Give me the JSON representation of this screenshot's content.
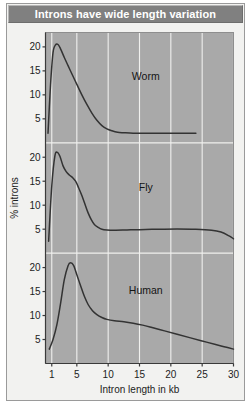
{
  "figure": {
    "title": "Introns have wide length variation",
    "xlabel": "Intron length in kb",
    "ylabel": "% introns"
  },
  "axis": {
    "x_ticks": [
      "1",
      "5",
      "10",
      "15",
      "20",
      "25",
      "30"
    ],
    "y_ticks_worm": [
      "20",
      "15",
      "10",
      "5"
    ],
    "y_ticks_fly": [
      "20",
      "15",
      "10",
      "5"
    ],
    "y_ticks_human": [
      "20",
      "15",
      "10",
      "5"
    ]
  },
  "panels": {
    "worm_label": "Worm",
    "fly_label": "Fly",
    "human_label": "Human"
  },
  "colors": {
    "title_bar": "#808080",
    "title_text": "#ffffff",
    "plot_background": "#a9a9a9",
    "gridline": "#f0f0ee",
    "curve": "#333333",
    "card_background": "#f2f2f0",
    "card_border": "#9a9a9a"
  },
  "chart_data": {
    "type": "line",
    "title": "Introns have wide length variation",
    "xlabel": "Intron length in kb",
    "ylabel": "% introns",
    "xlim": [
      0,
      30
    ],
    "ylim": [
      0,
      23
    ],
    "grid": true,
    "legend": "none",
    "xticks": [
      1,
      5,
      10,
      15,
      20,
      25,
      30
    ],
    "yticks": [
      5,
      10,
      15,
      20
    ],
    "panel_layout": "three stacked panels sharing x-axis, each with own y-axis 0-23",
    "series": [
      {
        "name": "Worm",
        "panel": 1,
        "annotation": "Worm",
        "x": [
          0.4,
          0.8,
          1.2,
          1.6,
          2.0,
          2.4,
          3.0,
          3.6,
          4.2,
          5.0,
          5.8,
          6.6,
          7.4,
          8.2,
          9.0,
          9.8,
          10.6,
          11.5,
          12.5,
          14.0,
          16.0,
          18.0,
          20.0,
          22.0,
          24.0
        ],
        "y": [
          2.0,
          12.0,
          18.8,
          20.4,
          20.5,
          19.6,
          17.8,
          16.1,
          14.4,
          12.2,
          10.0,
          8.0,
          6.2,
          4.7,
          3.6,
          2.9,
          2.5,
          2.2,
          2.1,
          2.0,
          2.0,
          2.0,
          2.0,
          2.0,
          2.0
        ]
      },
      {
        "name": "Fly",
        "panel": 2,
        "annotation": "Fly",
        "x": [
          0.5,
          1.0,
          1.5,
          1.9,
          2.3,
          2.8,
          3.3,
          3.8,
          4.3,
          4.8,
          5.3,
          5.8,
          6.3,
          6.8,
          7.3,
          7.8,
          8.4,
          9.0,
          9.8,
          11.0,
          13.0,
          15.0,
          18.0,
          21.0,
          24.0,
          26.5,
          28.0,
          29.3,
          30.0
        ],
        "y": [
          2.5,
          14.0,
          20.3,
          21.0,
          20.2,
          18.2,
          17.0,
          16.3,
          15.8,
          15.0,
          13.6,
          12.0,
          10.2,
          8.4,
          7.0,
          6.0,
          5.4,
          5.0,
          4.85,
          4.8,
          4.85,
          4.9,
          5.0,
          5.05,
          5.0,
          4.8,
          4.4,
          3.6,
          3.0
        ]
      },
      {
        "name": "Human",
        "panel": 3,
        "annotation": "Human",
        "x": [
          0.6,
          1.2,
          1.8,
          2.4,
          3.0,
          3.6,
          4.0,
          4.5,
          5.0,
          5.6,
          6.2,
          6.8,
          7.5,
          8.2,
          9.0,
          9.8,
          11.0,
          12.5,
          14.0,
          15.5,
          17.0,
          19.0,
          21.0,
          23.0,
          25.0,
          27.0,
          28.5,
          30.0
        ],
        "y": [
          3.0,
          5.0,
          8.0,
          12.5,
          17.5,
          20.4,
          21.0,
          20.4,
          18.5,
          16.2,
          14.0,
          12.3,
          11.0,
          10.2,
          9.6,
          9.2,
          8.9,
          8.7,
          8.4,
          8.0,
          7.5,
          6.8,
          6.1,
          5.4,
          4.7,
          4.0,
          3.5,
          3.0
        ]
      }
    ]
  }
}
